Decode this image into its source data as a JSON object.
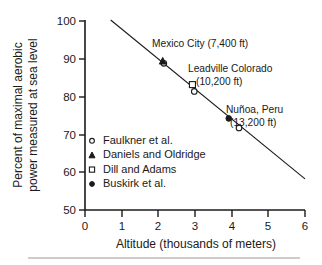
{
  "chart_data": {
    "type": "scatter",
    "title": "",
    "xlabel": "Altitude (thousands of meters)",
    "ylabel_line1": "Percent of maximal aerobic",
    "ylabel_line2": "power measured at sea level",
    "xlim": [
      0,
      6
    ],
    "ylim": [
      50,
      100
    ],
    "xticks": [
      0,
      1,
      2,
      3,
      4,
      5,
      6
    ],
    "yticks": [
      50,
      60,
      70,
      80,
      90,
      100
    ],
    "xtick_labels": [
      "0",
      "1",
      "2",
      "3",
      "4",
      "5",
      "6"
    ],
    "ytick_labels": [
      "50",
      "60",
      "70",
      "80",
      "90",
      "100"
    ],
    "grid": false,
    "legend_position": "inside-lower-left",
    "series": [
      {
        "name": "Faulkner et al.",
        "marker": "open-circle",
        "points": [
          {
            "x": 2.15,
            "y": 88.6
          },
          {
            "x": 2.98,
            "y": 81.2
          },
          {
            "x": 4.2,
            "y": 71.6
          }
        ]
      },
      {
        "name": "Daniels and Oldridge",
        "marker": "filled-triangle",
        "points": [
          {
            "x": 2.12,
            "y": 89.2
          }
        ]
      },
      {
        "name": "Dill and Adams",
        "marker": "open-square",
        "points": [
          {
            "x": 2.93,
            "y": 83.0
          }
        ]
      },
      {
        "name": "Buskirk et al.",
        "marker": "filled-circle",
        "points": [
          {
            "x": 3.92,
            "y": 74.1
          }
        ]
      }
    ],
    "trend_line": {
      "x1": 0.7,
      "y1": 100.0,
      "x2": 6.0,
      "y2": 58.2
    },
    "annotations": [
      {
        "name": "mexico-city",
        "text": "Mexico City (7,400 ft)",
        "x": 152,
        "y": 47,
        "anchor": "start"
      },
      {
        "name": "leadville-line1",
        "text": "Leadville Colorado",
        "x": 188,
        "y": 72,
        "anchor": "start"
      },
      {
        "name": "leadville-line2",
        "text": "(10,200 ft)",
        "x": 196,
        "y": 85,
        "anchor": "start"
      },
      {
        "name": "nunoa-line1",
        "text": "Nuñoa, Peru",
        "x": 226,
        "y": 113,
        "anchor": "start"
      },
      {
        "name": "nunoa-line2",
        "text": "(13,200 ft)",
        "x": 230,
        "y": 126,
        "anchor": "start"
      }
    ]
  },
  "legend": {
    "entries": [
      {
        "label": "Faulkner et al.",
        "marker": "open-circle"
      },
      {
        "label": "Daniels and Oldridge",
        "marker": "filled-triangle"
      },
      {
        "label": "Dill and Adams",
        "marker": "open-square"
      },
      {
        "label": "Buskirk et al.",
        "marker": "filled-circle"
      }
    ]
  },
  "colors": {
    "ink": "#1a1a1a",
    "paper": "#ffffff",
    "rule": "#9a9a9a"
  }
}
